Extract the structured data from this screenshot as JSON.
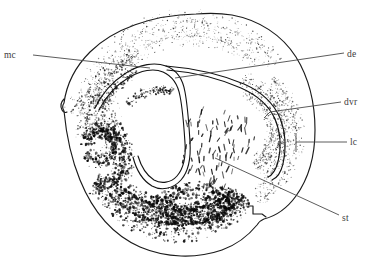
{
  "figure": {
    "kind": "anatomical-line-drawing",
    "background_color": "#ffffff",
    "outline_color": "#1b1b1b",
    "stipple_color": "#1a1a1a",
    "leader_color": "#4a4a4a",
    "label_color": "#3c3c3c",
    "width": 375,
    "height": 271
  },
  "labels": [
    {
      "id": "mc",
      "text": "mc",
      "meaning": "medial cortex",
      "side": "left",
      "text_x": 16,
      "text_y": 58,
      "leader": "M 33 55 L 150 68",
      "tick": ""
    },
    {
      "id": "de",
      "text": "de",
      "meaning": "dorsal cortex / ependymal zone",
      "side": "right",
      "text_x": 347,
      "text_y": 57,
      "leader": "M 344 53 L 175 78",
      "tick": ""
    },
    {
      "id": "dvr",
      "text": "dvr",
      "meaning": "dorsal ventricular ridge",
      "side": "right",
      "text_x": 344,
      "text_y": 105,
      "leader": "M 341 102 L 270 112",
      "tick": "M 270 112 L 264 118"
    },
    {
      "id": "lc",
      "text": "lc",
      "meaning": "lateral cortex",
      "side": "right",
      "text_x": 350,
      "text_y": 145,
      "leader": "M 347 142 L 296 142",
      "tick": "M 296 133 L 296 152"
    },
    {
      "id": "st",
      "text": "st",
      "meaning": "striatum",
      "side": "right",
      "text_x": 342,
      "text_y": 221,
      "leader": "M 339 215 L 215 158",
      "tick": ""
    }
  ],
  "outline": {
    "name": "hemisphere-outer-boundary",
    "path": "M 196 14 C 152 15 113 29 90 52 C 73 69 66 88 64 103 C 62 106 62 108 64 111 C 66 132 71 158 80 180 C 93 212 113 235 140 247 C 166 258 196 259 222 250 C 236 245 248 236 257 225 C 259 222 261 220 264 219 C 276 216 288 207 296 196 C 309 178 315 154 315 130 C 315 104 309 78 296 57 C 282 35 259 20 232 15 C 220 13 208 13 196 14 Z"
  },
  "outline_notches": [
    {
      "name": "left-edge-notch",
      "path": "M 64 99 C 61 102 60 106 62 110 C 63 112 65 113 67 112"
    },
    {
      "name": "ventral-lateral-notch",
      "path": "M 248 206 L 253 206 L 253 214 L 262 214 L 266 217"
    }
  ],
  "ventricle": {
    "name": "lateral-ventricle-slit",
    "outer_path": "M 95 108 C 101 95 112 82 126 73 C 140 64 155 62 166 66 C 177 70 183 80 185 92 C 188 108 189 126 190 142 C 191 158 189 171 181 180 C 173 189 161 191 152 186 C 142 180 136 169 133 157",
    "inner_path": "M 99 110 C 105 98 115 86 128 78 C 141 70 154 68 163 72 C 172 76 178 85 180 96 C 183 111 184 128 185 143 C 186 157 184 168 177 176 C 171 183 161 184 154 180 C 146 175 141 166 138 156",
    "lateral_outer_path": "M 166 66 C 192 68 220 74 244 84 C 262 92 274 104 280 118 C 286 133 286 150 283 164 C 281 172 277 178 272 180",
    "lateral_inner_path": "M 167 70 C 192 72 218 78 241 88 C 257 95 269 106 275 119 C 281 133 281 149 278 162 C 276 169 273 175 268 177",
    "lateral_tip_path": "M 272 180 C 269 181 267 180 266 177 L 266 177 C 267 179 269 179 268 177"
  },
  "regions": [
    {
      "id": "de",
      "name": "dorsal-ependymal-stipple-band",
      "density": "light",
      "tone": "#555555",
      "description": "fine sparse stipple arc along the dorsal margin between outline and ventricle roof"
    },
    {
      "id": "mc",
      "name": "medial-cortex-stipple",
      "density": "medium",
      "tone": "#2e2e2e",
      "description": "medium stipple band on the dorsomedial shoulder"
    },
    {
      "id": "dvr",
      "name": "dorsal-ventricular-ridge-stipple",
      "density": "light-medium",
      "tone": "#4a4a4a",
      "description": "granular band following the lateral ventricle limb"
    },
    {
      "id": "lc",
      "name": "lateral-cortex-stipple",
      "density": "light",
      "tone": "#4f4f4f",
      "description": "narrow stipple lamina just inside the lateral outline"
    },
    {
      "id": "st",
      "name": "striatum-dash-field",
      "density": "medium",
      "tone": "#1a1a1a",
      "description": "field of short elongated dash marks ventrolateral to the ventricle"
    },
    {
      "id": "ventral-dense-left",
      "name": "ventromedial-dense-cluster",
      "density": "heavy",
      "tone": "#101010",
      "description": "dark dense stipple mass in the ventromedial quadrant"
    },
    {
      "id": "ventral-dense-bottom",
      "name": "ventral-dense-band",
      "density": "heavy",
      "tone": "#101010",
      "description": "broad dark stipple band sweeping across the ventral floor"
    }
  ]
}
